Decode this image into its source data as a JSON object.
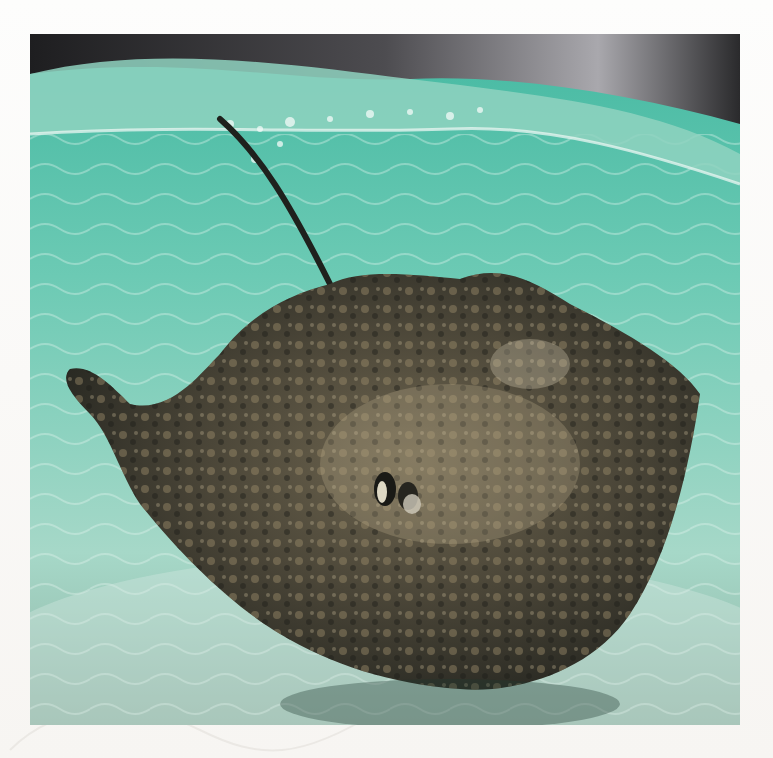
{
  "page": {
    "background_color": "#fbfaf8"
  },
  "photo": {
    "subject": "stingray swimming in shallow turquoise water below the surface",
    "alt": "Underwater photo of a southern stingray near the surface with sunlit sandy bottom",
    "colors": {
      "water": "#5fc4ad",
      "water_light": "#a9e0d2",
      "sky": "#4a4a4e",
      "ray_dark": "#2b2a24",
      "ray_mottle": "#8c7d5e",
      "sand": "#c9e6dc"
    }
  },
  "decorations": {
    "watermark": "faint line-art sea creature illustration"
  }
}
